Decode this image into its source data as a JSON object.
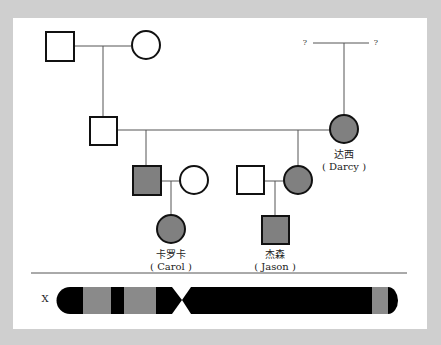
{
  "colors": {
    "background_frame": "#cfcfcf",
    "panel": "#ffffff",
    "affected_fill": "#808080",
    "unaffected_fill": "#ffffff",
    "outline": "#111111",
    "chromosome_dark": "#000000",
    "chromosome_band": "#8a8a8a"
  },
  "pedigree": {
    "unknown_parent_left": "?",
    "unknown_parent_right": "?",
    "individuals": [
      {
        "id": "gen1-father",
        "sex": "male",
        "affected": false
      },
      {
        "id": "gen1-mother",
        "sex": "female",
        "affected": false
      },
      {
        "id": "gen2-father",
        "sex": "male",
        "affected": false
      },
      {
        "id": "darcy",
        "sex": "female",
        "affected": true,
        "name_cn": "达西",
        "name_en": "( Darcy )"
      },
      {
        "id": "gen3-son",
        "sex": "male",
        "affected": true
      },
      {
        "id": "gen3-son-wife",
        "sex": "female",
        "affected": false
      },
      {
        "id": "gen3-daughter-husband",
        "sex": "male",
        "affected": false
      },
      {
        "id": "gen3-daughter",
        "sex": "female",
        "affected": true
      },
      {
        "id": "carol",
        "sex": "female",
        "affected": true,
        "name_cn": "卡罗卡",
        "name_en": "( Carol )"
      },
      {
        "id": "jason",
        "sex": "male",
        "affected": true,
        "name_cn": "杰森",
        "name_en": "( Jason )"
      }
    ]
  },
  "chromosome": {
    "label": "X",
    "bands": [
      "dark",
      "grey",
      "dark",
      "grey",
      "dark",
      "centromere",
      "dark",
      "grey",
      "dark-tip"
    ]
  }
}
